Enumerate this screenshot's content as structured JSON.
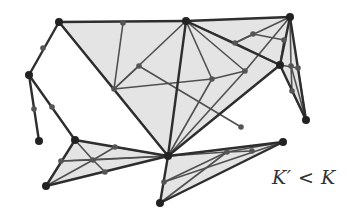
{
  "label": "K′ < K",
  "colors": {
    "fill": "#e4e4e4",
    "edge": "#2e2e2e",
    "inner_edge": "#505050",
    "node": "#222222",
    "small_node": "#555555"
  },
  "nodes": {
    "A": [
      59,
      22
    ],
    "B": [
      29,
      75
    ],
    "C": [
      39,
      141
    ],
    "D": [
      75,
      140
    ],
    "E": [
      46,
      186
    ],
    "F": [
      186,
      21
    ],
    "G": [
      290,
      17
    ],
    "H": [
      280,
      65
    ],
    "I": [
      306,
      120
    ],
    "J": [
      168,
      156
    ],
    "K": [
      160,
      203
    ],
    "L": [
      283,
      142
    ],
    "m1": [
      123,
      23
    ],
    "m2": [
      139,
      66
    ],
    "m3": [
      114,
      89
    ],
    "m4": [
      43,
      48
    ],
    "m5": [
      34,
      109
    ],
    "m6": [
      52,
      107
    ],
    "m7": [
      212,
      79
    ],
    "m8": [
      245,
      71
    ],
    "m9": [
      253,
      34
    ],
    "m10": [
      235,
      43
    ],
    "m11": [
      284,
      40
    ],
    "m12": [
      291,
      66
    ],
    "m13": [
      298,
      68
    ],
    "m14": [
      292,
      91
    ],
    "m15": [
      241,
      127
    ],
    "m16": [
      227,
      152
    ],
    "m17": [
      252,
      151
    ],
    "m18": [
      164,
      182
    ],
    "m19": [
      61,
      161
    ],
    "m20": [
      93,
      160
    ],
    "m21": [
      115,
      147
    ],
    "m22": [
      105,
      172
    ]
  },
  "faces": [
    [
      "A",
      "F",
      "J"
    ],
    [
      "F",
      "G",
      "H"
    ],
    [
      "F",
      "H",
      "J"
    ],
    [
      "G",
      "I",
      "H"
    ],
    [
      "D",
      "J",
      "E"
    ],
    [
      "J",
      "L",
      "K"
    ]
  ],
  "edges_outer": [
    [
      "A",
      "F"
    ],
    [
      "F",
      "G"
    ],
    [
      "A",
      "B"
    ],
    [
      "B",
      "C"
    ],
    [
      "B",
      "D"
    ],
    [
      "A",
      "J"
    ],
    [
      "F",
      "J"
    ],
    [
      "G",
      "H"
    ],
    [
      "G",
      "I"
    ],
    [
      "H",
      "I"
    ],
    [
      "H",
      "J"
    ],
    [
      "F",
      "H"
    ],
    [
      "D",
      "J"
    ],
    [
      "D",
      "E"
    ],
    [
      "E",
      "J"
    ],
    [
      "J",
      "L"
    ],
    [
      "J",
      "K"
    ],
    [
      "K",
      "L"
    ]
  ],
  "edges_inner": [
    [
      "m1",
      "m3"
    ],
    [
      "m3",
      "J"
    ],
    [
      "A",
      "m3"
    ],
    [
      "m3",
      "m7"
    ],
    [
      "m3",
      "m2"
    ],
    [
      "m3",
      "F"
    ],
    [
      "F",
      "m7"
    ],
    [
      "m7",
      "J"
    ],
    [
      "m7",
      "m8"
    ],
    [
      "m8",
      "G"
    ],
    [
      "m8",
      "F"
    ],
    [
      "m8",
      "J"
    ],
    [
      "F",
      "m10"
    ],
    [
      "m10",
      "G"
    ],
    [
      "m10",
      "m9"
    ],
    [
      "m9",
      "m11"
    ],
    [
      "m11",
      "H"
    ],
    [
      "m10",
      "H"
    ],
    [
      "G",
      "m12"
    ],
    [
      "m12",
      "I"
    ],
    [
      "H",
      "m13"
    ],
    [
      "m13",
      "I"
    ],
    [
      "m12",
      "m14"
    ],
    [
      "m14",
      "I"
    ],
    [
      "m2",
      "m15"
    ],
    [
      "m19",
      "m20"
    ],
    [
      "m20",
      "J"
    ],
    [
      "D",
      "m20"
    ],
    [
      "m20",
      "m22"
    ],
    [
      "E",
      "m20"
    ],
    [
      "m20",
      "m21"
    ],
    [
      "m21",
      "J"
    ],
    [
      "m19",
      "J"
    ],
    [
      "m18",
      "m16"
    ],
    [
      "m16",
      "L"
    ],
    [
      "m16",
      "m17"
    ],
    [
      "J",
      "m16"
    ],
    [
      "K",
      "m16"
    ],
    [
      "m18",
      "L"
    ]
  ],
  "big_nodes": [
    "A",
    "B",
    "C",
    "D",
    "E",
    "F",
    "G",
    "H",
    "I",
    "J",
    "K",
    "L"
  ],
  "small_nodes": [
    "m1",
    "m2",
    "m3",
    "m4",
    "m5",
    "m6",
    "m7",
    "m8",
    "m9",
    "m10",
    "m11",
    "m12",
    "m13",
    "m14",
    "m15",
    "m16",
    "m17",
    "m18",
    "m19",
    "m20",
    "m21",
    "m22"
  ]
}
